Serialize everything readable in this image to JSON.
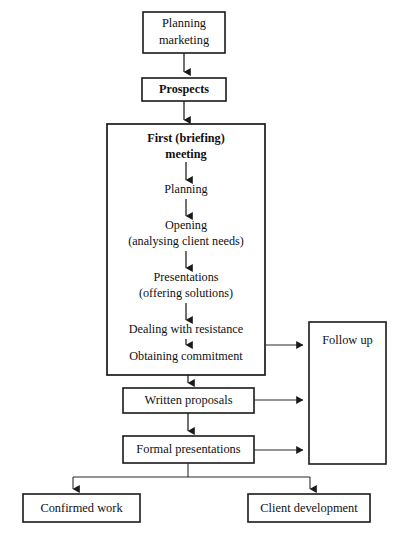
{
  "diagram": {
    "background_color": "#ffffff",
    "line_color": "#1a1a1a",
    "text_color": "#101010"
  },
  "nodes": {
    "planning_marketing": {
      "line1": "Planning",
      "line2": "marketing"
    },
    "prospects": {
      "label": "Prospects"
    },
    "meeting_group": {
      "heading_line1": "First (briefing)",
      "heading_line2": "meeting",
      "steps": [
        {
          "line1": "Planning",
          "line2": ""
        },
        {
          "line1": "Opening",
          "line2": "(analysing client needs)"
        },
        {
          "line1": "Presentations",
          "line2": "(offering solutions)"
        },
        {
          "line1": "Dealing with resistance",
          "line2": ""
        },
        {
          "line1": "Obtaining commitment",
          "line2": ""
        }
      ]
    },
    "follow_up": {
      "label": "Follow up"
    },
    "written_proposals": {
      "label": "Written proposals"
    },
    "formal_presentations": {
      "label": "Formal presentations"
    },
    "confirmed_work": {
      "label": "Confirmed work"
    },
    "client_development": {
      "label": "Client development"
    }
  }
}
